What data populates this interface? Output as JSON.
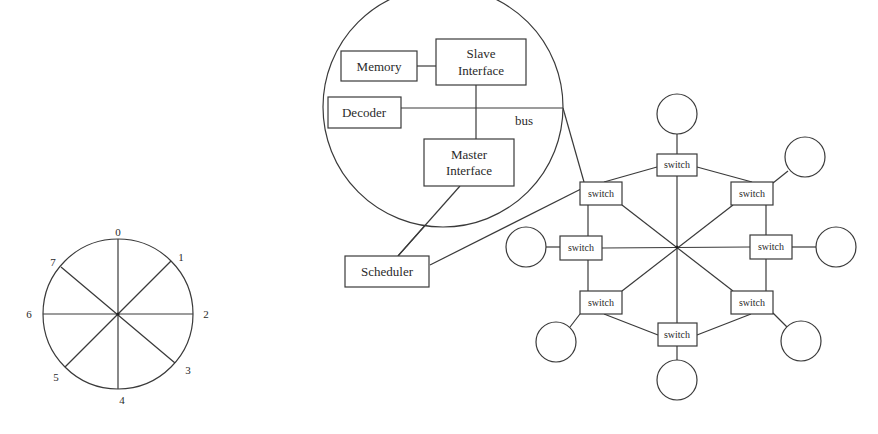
{
  "ring": {
    "center": [
      118,
      314
    ],
    "radius": 75,
    "nodes": [
      {
        "label": "0",
        "x": 118,
        "y": 232
      },
      {
        "label": "1",
        "x": 181,
        "y": 257
      },
      {
        "label": "2",
        "x": 206,
        "y": 318
      },
      {
        "label": "3",
        "x": 188,
        "y": 370
      },
      {
        "label": "4",
        "x": 122,
        "y": 400
      },
      {
        "label": "5",
        "x": 56,
        "y": 377
      },
      {
        "label": "6",
        "x": 29,
        "y": 318
      },
      {
        "label": "7",
        "x": 53,
        "y": 262
      }
    ]
  },
  "magnified": {
    "center": [
      443,
      107
    ],
    "radius": 120,
    "blocks": {
      "memory": {
        "line1": "Memory"
      },
      "slave": {
        "line1": "Slave",
        "line2": "Interface"
      },
      "decoder": {
        "line1": "Decoder"
      },
      "master": {
        "line1": "Master",
        "line2": "Interface"
      }
    },
    "bus_label": "bus"
  },
  "scheduler": {
    "label": "Scheduler"
  },
  "network": {
    "center": [
      677,
      247
    ],
    "switch_label": "switch",
    "switches": [
      {
        "id": "top",
        "label": "switch"
      },
      {
        "id": "upper-right",
        "label": "switch"
      },
      {
        "id": "right",
        "label": "switch"
      },
      {
        "id": "lower-right",
        "label": "switch"
      },
      {
        "id": "bottom",
        "label": "switch"
      },
      {
        "id": "lower-left",
        "label": "switch"
      },
      {
        "id": "left",
        "label": "switch"
      },
      {
        "id": "upper-left",
        "label": "switch"
      }
    ]
  }
}
